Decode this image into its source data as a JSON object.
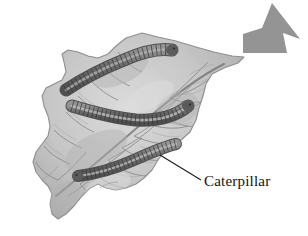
{
  "figure": {
    "background_color": "#ffffff",
    "style": "grayscale-illustration"
  },
  "annotations": {
    "caterpillar_label": "Caterpillar",
    "label_color": "#111111",
    "leader_line": {
      "from_x": 160,
      "from_y": 155,
      "to_x": 201,
      "to_y": 180,
      "color": "#1a1a1a"
    }
  },
  "arrow": {
    "name": "direction-arrow",
    "fill_color": "#949494",
    "points": "243,34 243,53 287,53 283,33 300,39 272,3 262,28",
    "direction": "up-right"
  },
  "leaf": {
    "fill_color": "#c9c9c9",
    "edge_color": "#8f8f8f",
    "vein_color": "#8a8a8a",
    "midrib_color": "#7d7d7d",
    "outline": "142,33 158,37 176,41 196,47 214,52 232,56 244,57 238,63 224,68 212,74 206,84 203,96 199,108 196,120 190,132 181,140 172,146 164,152 158,160 152,170 144,178 136,184 126,188 116,190 106,188 98,184 90,188 82,196 74,206 66,214 58,219 52,214 50,204 52,194 48,186 42,180 36,172 33,162 36,152 42,144 48,136 50,126 48,116 44,106 42,96 46,88 54,84 62,80 66,72 64,62 62,54 68,50 78,52 88,56 98,58 108,54 116,46 126,38"
  },
  "caterpillars": [
    {
      "id": "caterpillar-top",
      "body_color": "#6e6e6e",
      "highlight_color": "#a8a8a8",
      "segment_color": "#4a4a4a",
      "path": "M 66,90 C 84,78 104,68 124,60 C 142,52 158,48 172,50",
      "width": 11,
      "segments": 22
    },
    {
      "id": "caterpillar-middle",
      "body_color": "#6e6e6e",
      "highlight_color": "#a8a8a8",
      "segment_color": "#4a4a4a",
      "path": "M 72,106 C 92,112 114,118 136,120 C 158,121 176,116 188,106",
      "width": 11,
      "segments": 24
    },
    {
      "id": "caterpillar-bottom",
      "body_color": "#6e6e6e",
      "highlight_color": "#a8a8a8",
      "segment_color": "#4a4a4a",
      "path": "M 78,176 C 96,174 116,168 134,160 C 152,152 166,146 176,144",
      "width": 10,
      "segments": 22
    }
  ]
}
